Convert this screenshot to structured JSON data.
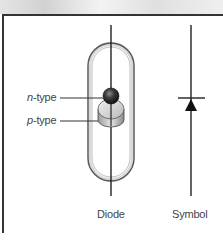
{
  "diagram": {
    "labels": {
      "n_type_prefix": "n",
      "n_type_suffix": "-type",
      "p_type_prefix": "p",
      "p_type_suffix": "-type",
      "diode": "Diode",
      "symbol": "Symbol"
    },
    "colors": {
      "frame": "#333333",
      "line": "#222222",
      "sphere": "#3a3a3a",
      "disk": "#c8c8c8",
      "text": "#444444"
    }
  }
}
